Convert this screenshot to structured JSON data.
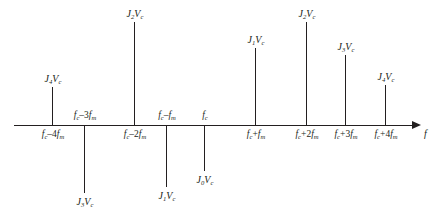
{
  "figure": {
    "type": "fm-spectrum-line-diagram",
    "axis": {
      "variable_label": "f",
      "line_y": 125,
      "x_start": 14,
      "x_end": 420,
      "arrow_label": "f"
    },
    "colors": {
      "ink": "#231f20",
      "background": "#ffffff"
    }
  },
  "lines": [
    {
      "id": "line-minus-4fm",
      "x": 52,
      "frequency_label": "f_c–4f_m",
      "frequency_html": "<i>f</i><sub>c</sub>–4<i>f</i><sub>m</sub>",
      "freq_label_side": "below",
      "amplitude_label": "J_4V_c",
      "amplitude_html": "<i>J</i><sub>4</sub><i>V</i><sub>c</sub>",
      "direction": "up",
      "length": 38
    },
    {
      "id": "line-minus-3fm",
      "x": 84,
      "frequency_label": "f_c–3f_m",
      "frequency_html": "<i>f</i><sub>c</sub>–3<i>f</i><sub>m</sub>",
      "freq_label_side": "above",
      "amplitude_label": "J_3V_c",
      "amplitude_html": "<i>J</i><sub>3</sub><i>V</i><sub>c</sub>",
      "direction": "down",
      "length": 68
    },
    {
      "id": "line-minus-2fm",
      "x": 134,
      "frequency_label": "f_c–2f_m",
      "frequency_html": "<i>f</i><sub>c</sub>–2<i>f</i><sub>m</sub>",
      "freq_label_side": "below",
      "amplitude_label": "J_2V_c",
      "amplitude_html": "<i>J</i><sub>2</sub><i>V</i><sub>c</sub>",
      "direction": "up",
      "length": 103
    },
    {
      "id": "line-minus-1fm",
      "x": 166,
      "frequency_label": "f_c–f_m",
      "frequency_html": "<i>f</i><sub>c</sub>–<i>f</i><sub>m</sub>",
      "freq_label_side": "above",
      "amplitude_label": "J_1V_c",
      "amplitude_html": "<i>J</i><sub>1</sub><i>V</i><sub>c</sub>",
      "direction": "down",
      "length": 62
    },
    {
      "id": "line-center",
      "x": 204,
      "frequency_label": "f_c",
      "frequency_html": "<i>f</i><sub>c</sub>",
      "freq_label_side": "above",
      "amplitude_label": "J_0V_c",
      "amplitude_html": "<i>J</i><sub>0</sub><i>V</i><sub>c</sub>",
      "direction": "down",
      "length": 46
    },
    {
      "id": "line-plus-1fm",
      "x": 255,
      "frequency_label": "f_c+f_m",
      "frequency_html": "<i>f</i><sub>c</sub>+<i>f</i><sub>m</sub>",
      "freq_label_side": "below",
      "amplitude_label": "J_1V_c",
      "amplitude_html": "<i>J</i><sub>1</sub><i>V</i><sub>c</sub>",
      "direction": "up",
      "length": 77
    },
    {
      "id": "line-plus-2fm",
      "x": 306,
      "frequency_label": "f_c+2f_m",
      "frequency_html": "<i>f</i><sub>c</sub>+2<i>f</i><sub>m</sub>",
      "freq_label_side": "below",
      "amplitude_label": "J_2V_c",
      "amplitude_html": "<i>J</i><sub>2</sub><i>V</i><sub>c</sub>",
      "direction": "up",
      "length": 103
    },
    {
      "id": "line-plus-3fm",
      "x": 345,
      "frequency_label": "f_c+3f_m",
      "frequency_html": "<i>f</i><sub>c</sub>+3<i>f</i><sub>m</sub>",
      "freq_label_side": "below",
      "amplitude_label": "J_3V_c",
      "amplitude_html": "<i>J</i><sub>3</sub><i>V</i><sub>c</sub>",
      "direction": "up",
      "length": 70
    },
    {
      "id": "line-plus-4fm",
      "x": 385,
      "frequency_label": "f_c+4f_m",
      "frequency_html": "<i>f</i><sub>c</sub>+4<i>f</i><sub>m</sub>",
      "freq_label_side": "below",
      "amplitude_label": "J_4V_c",
      "amplitude_html": "<i>J</i><sub>4</sub><i>V</i><sub>c</sub>",
      "direction": "up",
      "length": 40
    }
  ],
  "chart_data": {
    "type": "bar",
    "title": "",
    "xlabel": "f",
    "ylabel": "",
    "grid": false,
    "legend": null,
    "categories": [
      "f_c–4f_m",
      "f_c–3f_m",
      "f_c–2f_m",
      "f_c–f_m",
      "f_c",
      "f_c+f_m",
      "f_c+2f_m",
      "f_c+3f_m",
      "f_c+4f_m"
    ],
    "value_labels": [
      "J_4V_c",
      "J_3V_c",
      "J_2V_c",
      "J_1V_c",
      "J_0V_c",
      "J_1V_c",
      "J_2V_c",
      "J_3V_c",
      "J_4V_c"
    ],
    "values": [
      38,
      -68,
      103,
      -62,
      -46,
      77,
      103,
      70,
      40
    ],
    "note": "Signed stem lengths in pixels; negative = drawn below the frequency axis (phase inversion)."
  }
}
